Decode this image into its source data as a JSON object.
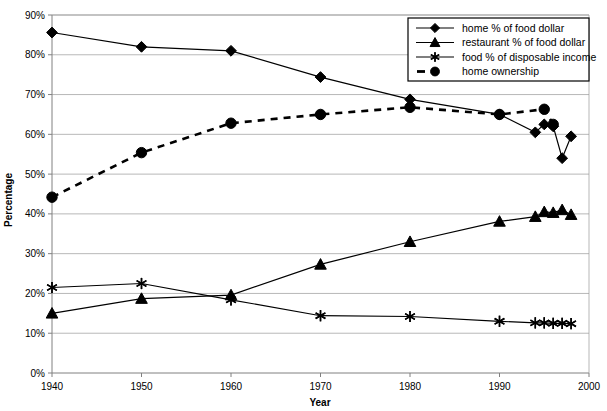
{
  "chart_data": {
    "type": "line",
    "title": "",
    "xlabel": "Year",
    "ylabel": "Percentage",
    "xlim": [
      1940,
      2000
    ],
    "ylim": [
      0,
      90
    ],
    "grid": true,
    "legend_position": "top-right",
    "xticks": [
      "1940",
      "1950",
      "1960",
      "1970",
      "1980",
      "1990",
      "2000"
    ],
    "xtick_values": [
      1940,
      1950,
      1960,
      1970,
      1980,
      1990,
      2000
    ],
    "yticks": [
      "0%",
      "10%",
      "20%",
      "30%",
      "40%",
      "50%",
      "60%",
      "70%",
      "80%",
      "90%"
    ],
    "ytick_values": [
      0,
      10,
      20,
      30,
      40,
      50,
      60,
      70,
      80,
      90
    ],
    "series": [
      {
        "name": "home % of food dollar",
        "marker": "diamond",
        "linestyle": "solid",
        "x": [
          1940,
          1950,
          1960,
          1970,
          1980,
          1990,
          1994,
          1995,
          1996,
          1997,
          1998
        ],
        "values": [
          85.6,
          82.0,
          81.0,
          74.4,
          68.8,
          65.0,
          60.5,
          62.5,
          62.0,
          54.0,
          59.5
        ]
      },
      {
        "name": "restaurant % of food dollar",
        "marker": "triangle",
        "linestyle": "solid",
        "x": [
          1940,
          1950,
          1960,
          1970,
          1980,
          1990,
          1994,
          1995,
          1996,
          1997,
          1998
        ],
        "values": [
          15.0,
          18.7,
          19.6,
          27.3,
          33.0,
          38.1,
          39.3,
          40.5,
          40.3,
          41.0,
          39.8
        ]
      },
      {
        "name": "food % of disposable income",
        "marker": "asterisk",
        "linestyle": "solid",
        "x": [
          1940,
          1950,
          1960,
          1970,
          1980,
          1990,
          1994,
          1995,
          1996,
          1997,
          1998
        ],
        "values": [
          21.5,
          22.5,
          18.4,
          14.4,
          14.2,
          13.0,
          12.6,
          12.6,
          12.5,
          12.5,
          12.4
        ]
      },
      {
        "name": "home ownership",
        "marker": "circle",
        "linestyle": "dashed",
        "x": [
          1940,
          1950,
          1960,
          1970,
          1980,
          1990,
          1995,
          1996
        ],
        "values": [
          44.2,
          55.4,
          62.8,
          65.0,
          66.8,
          65.0,
          66.3,
          62.5
        ]
      }
    ],
    "legend": [
      {
        "label": "home % of food dollar",
        "marker": "diamond",
        "linestyle": "solid"
      },
      {
        "label": "restaurant % of food dollar",
        "marker": "triangle",
        "linestyle": "solid"
      },
      {
        "label": "food % of disposable income",
        "marker": "asterisk",
        "linestyle": "solid"
      },
      {
        "label": "home ownership",
        "marker": "circle",
        "linestyle": "dashed"
      }
    ],
    "colors": {
      "series": "#000000",
      "grid": "#9a9a9a",
      "axis": "#808080",
      "background": "#ffffff"
    }
  }
}
